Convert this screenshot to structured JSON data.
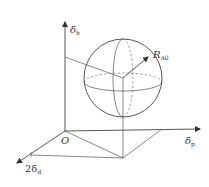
{
  "diagram": {
    "axes": {
      "vertical": {
        "label": "δ",
        "subscript": "h"
      },
      "horizontal": {
        "label": "δ",
        "subscript": "p"
      },
      "depth": {
        "label": "2δ",
        "subscript": "d"
      }
    },
    "origin_label": "O",
    "radius": {
      "label": "R",
      "subscript": "A0"
    },
    "colors": {
      "line": "#444444",
      "dashed": "#666666",
      "background": "#ffffff"
    }
  }
}
